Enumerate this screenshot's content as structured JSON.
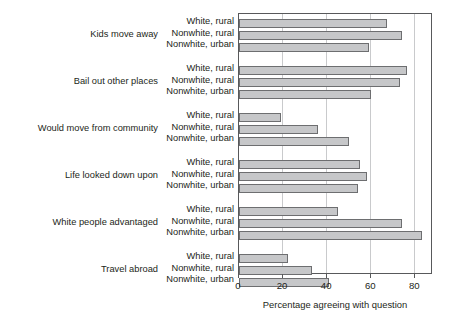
{
  "chart_data": {
    "type": "bar",
    "orientation": "horizontal",
    "title": "",
    "xlabel": "Percentage agreeing with question",
    "ylabel": "",
    "xlim": [
      0,
      88
    ],
    "xticks": [
      0,
      20,
      40,
      60,
      80
    ],
    "xtick_labels": [
      "0",
      "20",
      "40",
      "60",
      "80"
    ],
    "grid": "vertical",
    "legend": "none",
    "series_names": [
      "White, rural",
      "Nonwhite, rural",
      "Nonwhite, urban"
    ],
    "categories": [
      "Kids move away",
      "Bail out other places",
      "Would move from community",
      "Life looked down upon",
      "White people advantaged",
      "Travel abroad"
    ],
    "groups": [
      {
        "category": "Kids move away",
        "bars": [
          {
            "label": "White, rural",
            "value": 67
          },
          {
            "label": "Nonwhite, rural",
            "value": 74
          },
          {
            "label": "Nonwhite, urban",
            "value": 59
          }
        ]
      },
      {
        "category": "Bail out other places",
        "bars": [
          {
            "label": "White, rural",
            "value": 76
          },
          {
            "label": "Nonwhite, rural",
            "value": 73
          },
          {
            "label": "Nonwhite, urban",
            "value": 60
          }
        ]
      },
      {
        "category": "Would move from community",
        "bars": [
          {
            "label": "White, rural",
            "value": 19
          },
          {
            "label": "Nonwhite, rural",
            "value": 36
          },
          {
            "label": "Nonwhite, urban",
            "value": 50
          }
        ]
      },
      {
        "category": "Life looked down upon",
        "bars": [
          {
            "label": "White, rural",
            "value": 55
          },
          {
            "label": "Nonwhite, rural",
            "value": 58
          },
          {
            "label": "Nonwhite, urban",
            "value": 54
          }
        ]
      },
      {
        "category": "White people advantaged",
        "bars": [
          {
            "label": "White, rural",
            "value": 45
          },
          {
            "label": "Nonwhite, rural",
            "value": 74
          },
          {
            "label": "Nonwhite, urban",
            "value": 83
          }
        ]
      },
      {
        "category": "Travel abroad",
        "bars": [
          {
            "label": "White, rural",
            "value": 22
          },
          {
            "label": "Nonwhite, rural",
            "value": 33
          },
          {
            "label": "Nonwhite, urban",
            "value": 41
          }
        ]
      }
    ],
    "colors": {
      "bar_fill": "#c6c7c9",
      "bar_border": "#6d6e70",
      "gridline": "#c9cacc",
      "axis": "#58595b",
      "text": "#231f20",
      "background": "#ffffff"
    }
  }
}
